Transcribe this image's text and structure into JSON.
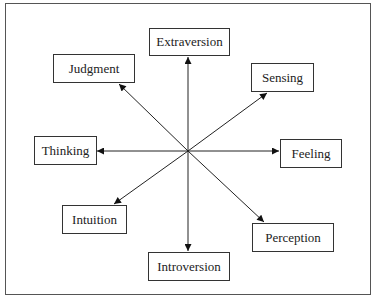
{
  "diagram": {
    "center": {
      "x": 188,
      "y": 151
    },
    "nodes": [
      {
        "id": "extraversion",
        "label": "Extraversion",
        "x": 149,
        "y": 28,
        "w": 81,
        "h": 28,
        "tip": [
          188,
          57
        ]
      },
      {
        "id": "sensing",
        "label": "Sensing",
        "x": 251,
        "y": 63,
        "w": 63,
        "h": 29,
        "tip": [
          267,
          93
        ]
      },
      {
        "id": "feeling",
        "label": "Feeling",
        "x": 280,
        "y": 139,
        "w": 62,
        "h": 29,
        "tip": [
          279,
          151
        ]
      },
      {
        "id": "perception",
        "label": "Perception",
        "x": 252,
        "y": 223,
        "w": 82,
        "h": 29,
        "tip": [
          264,
          222
        ]
      },
      {
        "id": "introversion",
        "label": "Introversion",
        "x": 148,
        "y": 252,
        "w": 82,
        "h": 29,
        "tip": [
          188,
          251
        ]
      },
      {
        "id": "intuition",
        "label": "Intuition",
        "x": 62,
        "y": 205,
        "w": 65,
        "h": 29,
        "tip": [
          114,
          204
        ]
      },
      {
        "id": "thinking",
        "label": "Thinking",
        "x": 34,
        "y": 136,
        "w": 63,
        "h": 29,
        "tip": [
          97,
          151
        ]
      },
      {
        "id": "judgment",
        "label": "Judgment",
        "x": 53,
        "y": 54,
        "w": 82,
        "h": 29,
        "tip": [
          119,
          84
        ]
      }
    ]
  }
}
